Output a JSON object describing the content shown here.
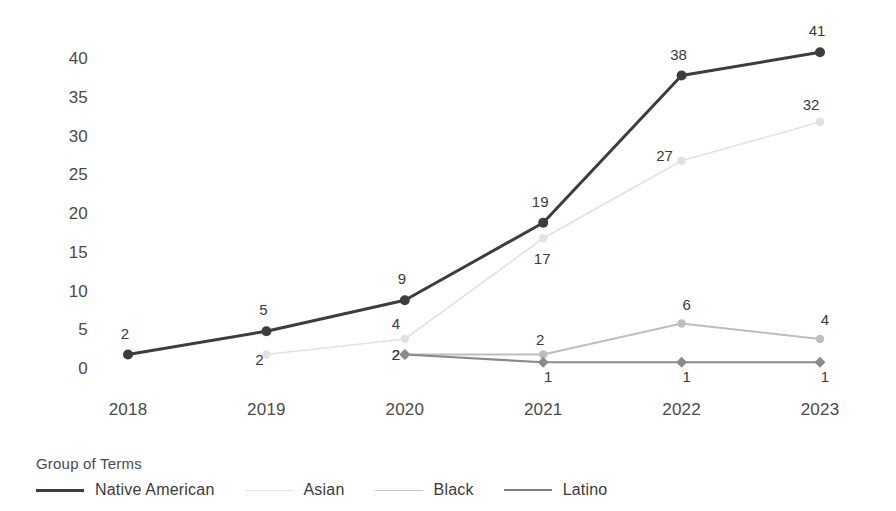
{
  "chart_data": {
    "type": "line",
    "title": "",
    "xlabel": "",
    "ylabel": "",
    "categories": [
      "2018",
      "2019",
      "2020",
      "2021",
      "2022",
      "2023"
    ],
    "ylim": [
      0,
      41
    ],
    "yticks": [
      0,
      5,
      10,
      15,
      20,
      25,
      30,
      35,
      40
    ],
    "ytick_labels": [
      "0",
      "5",
      "10",
      "15",
      "20",
      "25",
      "30",
      "35",
      "40"
    ],
    "grid": false,
    "legend_position": "bottom-left",
    "legend_title": "Group of Terms",
    "series": [
      {
        "name": "Native American",
        "color": "#3d3d3d",
        "marker": "circle",
        "line_width": 3,
        "x": [
          "2018",
          "2019",
          "2020",
          "2021",
          "2022",
          "2023"
        ],
        "values": [
          2,
          5,
          9,
          19,
          38,
          41
        ],
        "labels": [
          "2",
          "5",
          "9",
          "19",
          "38",
          "41"
        ]
      },
      {
        "name": "Asian",
        "color": "#e2e2e2",
        "marker": "circle",
        "line_width": 1.6,
        "x": [
          "2019",
          "2020",
          "2021",
          "2022",
          "2023"
        ],
        "values": [
          2,
          4,
          17,
          27,
          32
        ],
        "labels": [
          "2",
          "4",
          "17",
          "27",
          "32"
        ]
      },
      {
        "name": "Black",
        "color": "#bdbdbd",
        "marker": "circle",
        "line_width": 1.8,
        "x": [
          "2020",
          "2021",
          "2022",
          "2023"
        ],
        "values": [
          2,
          2,
          6,
          4
        ],
        "labels": [
          "2",
          "2",
          "6",
          "4"
        ]
      },
      {
        "name": "Latino",
        "color": "#8a8a8a",
        "marker": "diamond",
        "line_width": 2.2,
        "x": [
          "2020",
          "2021",
          "2022",
          "2023"
        ],
        "values": [
          2,
          1,
          1,
          1
        ],
        "labels": [
          "2",
          "1",
          "1",
          "1"
        ]
      }
    ]
  },
  "legend": {
    "title": "Group of Terms",
    "items": [
      {
        "label": "Native American",
        "color": "#3d3d3d",
        "width": "3px"
      },
      {
        "label": "Asian",
        "color": "#e2e2e2",
        "width": "1.6px"
      },
      {
        "label": "Black",
        "color": "#c4c4c4",
        "width": "1.8px"
      },
      {
        "label": "Latino",
        "color": "#7d7d7d",
        "width": "2.4px"
      }
    ]
  }
}
